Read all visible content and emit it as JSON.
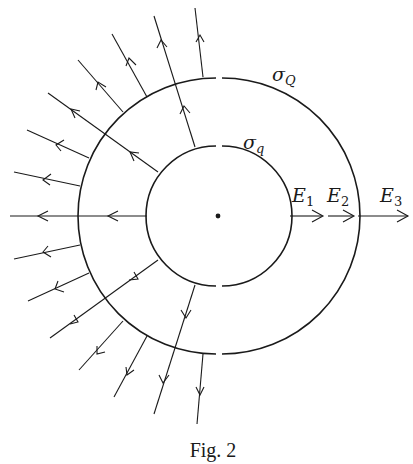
{
  "figure": {
    "caption": "Fig. 2",
    "labels": {
      "outer_charge": {
        "symbol": "σ",
        "subscript": "Q"
      },
      "inner_charge": {
        "symbol": "σ",
        "subscript": "q"
      },
      "e1": {
        "symbol": "E",
        "subscript": "1"
      },
      "e2": {
        "symbol": "E",
        "subscript": "2"
      },
      "e3": {
        "symbol": "E",
        "subscript": "3"
      }
    },
    "geometry": {
      "center": [
        218,
        216
      ],
      "inner_radius": 70,
      "outer_radius": 138
    },
    "colors": {
      "ink": "#1a1a1a",
      "background": "#ffffff"
    }
  }
}
